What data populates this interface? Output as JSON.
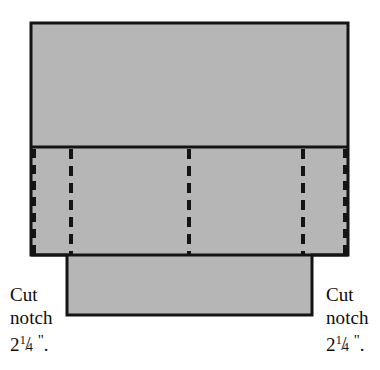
{
  "diagram": {
    "fill_color": "#b6b6b6",
    "stroke_color": "#141414",
    "background_color": "#ffffff",
    "outline": {
      "left": 31,
      "right": 348,
      "top": 23,
      "top_panel_bottom": 147,
      "middle_band_bottom": 255,
      "notch_shoulder_y": 272,
      "tab_bottom": 315,
      "notch_left_x": 67,
      "notch_right_x": 312
    },
    "panels": [
      {
        "name": "top-panel",
        "y_top": 23,
        "y_bottom": 147
      },
      {
        "name": "middle-band",
        "y_top": 147,
        "y_bottom": 255
      },
      {
        "name": "bottom-tab",
        "y_top": 255,
        "y_bottom": 315
      }
    ],
    "fold_lines": [
      {
        "name": "fold-line-left-edge",
        "x": 33,
        "style": "dashed"
      },
      {
        "name": "fold-line-1",
        "x": 71,
        "style": "dashed"
      },
      {
        "name": "fold-line-2",
        "x": 189,
        "style": "dashed"
      },
      {
        "name": "fold-line-3",
        "x": 303,
        "style": "dashed"
      },
      {
        "name": "fold-line-right-edge",
        "x": 346,
        "style": "dashed"
      }
    ],
    "solid_dividers": [
      {
        "name": "divider-top",
        "y": 147
      },
      {
        "name": "divider-bottom",
        "y": 255
      }
    ]
  },
  "labels": {
    "left": {
      "line1": "Cut",
      "line2": "notch",
      "measure_whole": "2",
      "measure_numerator": "1",
      "measure_slash": "/",
      "measure_denominator": "4",
      "measure_unit": "\"",
      "measure_period": "."
    },
    "right": {
      "line1": "Cut",
      "line2": "notch",
      "measure_whole": "2",
      "measure_numerator": "1",
      "measure_slash": "/",
      "measure_denominator": "4",
      "measure_unit": "\"",
      "measure_period": "."
    }
  }
}
